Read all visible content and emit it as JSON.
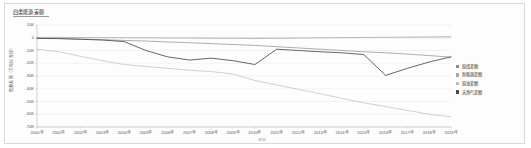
{
  "panel": {
    "title": "四类能源差额"
  },
  "axes": {
    "ylabel": "能源差额（万吨标准煤）",
    "xlabel": "年份",
    "yticks": [
      "10K",
      "0",
      "-10K",
      "-20K",
      "-30K",
      "-40K",
      "-50K",
      "-60K",
      "-70K"
    ],
    "ytick_values": [
      10000,
      0,
      -10000,
      -20000,
      -30000,
      -40000,
      -50000,
      -60000,
      -70000
    ],
    "xticks": [
      "2000年",
      "2001年",
      "2002年",
      "2003年",
      "2004年",
      "2005年",
      "2006年",
      "2007年",
      "2008年",
      "2009年",
      "2010年",
      "2011年",
      "2012年",
      "2013年",
      "2014年",
      "2015年",
      "2016年",
      "2017年",
      "2018年",
      "2019年"
    ]
  },
  "legend": {
    "position": "right",
    "items": [
      {
        "label": "原煤差额",
        "color": "#8b8b8b"
      },
      {
        "label": "新能源差额",
        "color": "#a8a8a8"
      },
      {
        "label": "原油差额",
        "color": "#bdbdbd"
      },
      {
        "label": "天然气差额",
        "color": "#4a4a4a"
      }
    ]
  },
  "chart_data": {
    "type": "line",
    "title": "四类能源差额",
    "xlabel": "年份",
    "ylabel": "能源差额（万吨标准煤）",
    "ylim": [
      -70000,
      10000
    ],
    "grid": true,
    "legend_position": "right",
    "x": [
      "2000年",
      "2001年",
      "2002年",
      "2003年",
      "2004年",
      "2005年",
      "2006年",
      "2007年",
      "2008年",
      "2009年",
      "2010年",
      "2011年",
      "2012年",
      "2013年",
      "2014年",
      "2015年",
      "2016年",
      "2017年",
      "2018年",
      "2019年"
    ],
    "series": [
      {
        "name": "原煤差额",
        "color": "#8b8b8b",
        "values": [
          -400,
          -500,
          -1100,
          -1500,
          -2100,
          -2600,
          -3300,
          -3900,
          -4600,
          -5300,
          -6000,
          -7000,
          -8000,
          -9000,
          -10000,
          -11000,
          -11800,
          -12800,
          -14000,
          -15200
        ]
      },
      {
        "name": "新能源差额",
        "color": "#a8a8a8",
        "values": [
          200,
          300,
          200,
          100,
          0,
          -100,
          -200,
          -300,
          -400,
          -500,
          -600,
          -500,
          -300,
          -100,
          100,
          250,
          400,
          550,
          700,
          900
        ]
      },
      {
        "name": "原油差额",
        "color": "#bdbdbd",
        "values": [
          -9000,
          -11000,
          -14500,
          -18000,
          -21000,
          -22500,
          -24000,
          -25500,
          -26500,
          -28500,
          -33500,
          -37000,
          -40500,
          -44000,
          -47500,
          -51000,
          -54000,
          -57000,
          -60000,
          -62000
        ]
      },
      {
        "name": "天然气差额",
        "color": "#4a4a4a",
        "values": [
          -500,
          -700,
          -1200,
          -1800,
          -3000,
          -10000,
          -15000,
          -17500,
          -16000,
          -18000,
          -21000,
          -9000,
          -10000,
          -11000,
          -11800,
          -13200,
          -29500,
          -24000,
          -19000,
          -15000
        ]
      }
    ]
  }
}
